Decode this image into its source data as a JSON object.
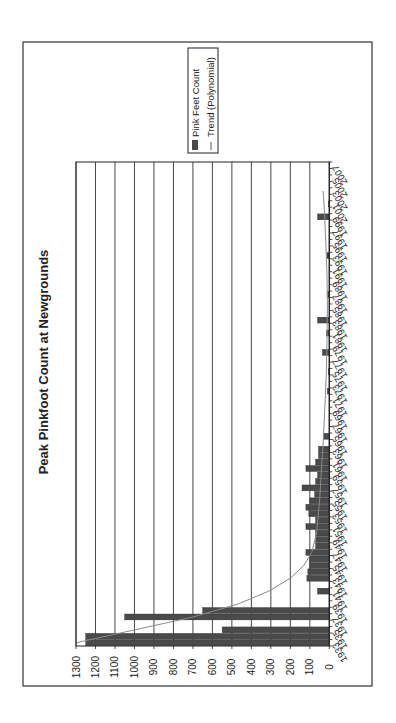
{
  "chart_data": {
    "type": "bar",
    "orientation_note": "figure rotated 90 degrees counter-clockwise",
    "title": "Peak Pinkfoot Count at Newgrounds",
    "xlabel": "",
    "ylabel": "",
    "ylim": [
      0,
      1300
    ],
    "yticks": [
      0,
      100,
      200,
      300,
      400,
      500,
      600,
      700,
      800,
      900,
      1000,
      1100,
      1200,
      1300
    ],
    "xlim": [
      1933,
      2007
    ],
    "xtick_labels": [
      "1933",
      "1935",
      "1937",
      "1939",
      "1941",
      "1943",
      "1945",
      "1947",
      "1949",
      "1951",
      "1953",
      "1955",
      "1957",
      "1959",
      "1961",
      "1963",
      "1965",
      "1967",
      "1969",
      "1971",
      "1973",
      "1975",
      "1977",
      "1979",
      "1981",
      "1983",
      "1985",
      "1987",
      "1989",
      "1991",
      "1993",
      "1995",
      "1997",
      "1999",
      "2001",
      "2003",
      "2005",
      "2007"
    ],
    "grid": true,
    "legend_position": "upper right (rotated)",
    "legend": [
      "Pink Feet Count",
      "Trend (Polynomial)"
    ],
    "series": [
      {
        "name": "Pink Feet Count",
        "type": "bar",
        "color": "#4a4a4a",
        "points": [
          {
            "x": 1933,
            "y": 1250
          },
          {
            "x": 1934,
            "y": 1250
          },
          {
            "x": 1935,
            "y": 550
          },
          {
            "x": 1936,
            "y": 0
          },
          {
            "x": 1937,
            "y": 1050
          },
          {
            "x": 1938,
            "y": 650
          },
          {
            "x": 1939,
            "y": 0
          },
          {
            "x": 1940,
            "y": 0
          },
          {
            "x": 1941,
            "y": 60
          },
          {
            "x": 1942,
            "y": 0
          },
          {
            "x": 1943,
            "y": 115
          },
          {
            "x": 1944,
            "y": 110
          },
          {
            "x": 1945,
            "y": 100
          },
          {
            "x": 1946,
            "y": 100
          },
          {
            "x": 1947,
            "y": 120
          },
          {
            "x": 1948,
            "y": 70
          },
          {
            "x": 1949,
            "y": 70
          },
          {
            "x": 1950,
            "y": 70
          },
          {
            "x": 1951,
            "y": 120
          },
          {
            "x": 1952,
            "y": 70
          },
          {
            "x": 1953,
            "y": 105
          },
          {
            "x": 1954,
            "y": 120
          },
          {
            "x": 1955,
            "y": 100
          },
          {
            "x": 1956,
            "y": 75
          },
          {
            "x": 1957,
            "y": 140
          },
          {
            "x": 1958,
            "y": 70
          },
          {
            "x": 1959,
            "y": 60
          },
          {
            "x": 1960,
            "y": 120
          },
          {
            "x": 1961,
            "y": 70
          },
          {
            "x": 1962,
            "y": 55
          },
          {
            "x": 1963,
            "y": 55
          },
          {
            "x": 1964,
            "y": 0
          },
          {
            "x": 1965,
            "y": 30
          },
          {
            "x": 1972,
            "y": 10
          },
          {
            "x": 1975,
            "y": 5
          },
          {
            "x": 1978,
            "y": 35
          },
          {
            "x": 1981,
            "y": 15
          },
          {
            "x": 1983,
            "y": 60
          },
          {
            "x": 1987,
            "y": 8
          },
          {
            "x": 1993,
            "y": 12
          },
          {
            "x": 1999,
            "y": 60
          },
          {
            "x": 2001,
            "y": 5
          }
        ]
      },
      {
        "name": "Trend (Polynomial)",
        "type": "line",
        "color": "#8a8a8a",
        "points": [
          {
            "x": 1933,
            "y": 1300
          },
          {
            "x": 1935,
            "y": 1000
          },
          {
            "x": 1937,
            "y": 700
          },
          {
            "x": 1939,
            "y": 470
          },
          {
            "x": 1941,
            "y": 310
          },
          {
            "x": 1943,
            "y": 200
          },
          {
            "x": 1945,
            "y": 130
          },
          {
            "x": 1947,
            "y": 90
          },
          {
            "x": 1950,
            "y": 65
          },
          {
            "x": 1955,
            "y": 50
          },
          {
            "x": 1960,
            "y": 40
          },
          {
            "x": 1965,
            "y": 30
          },
          {
            "x": 1970,
            "y": 22
          },
          {
            "x": 1975,
            "y": 15
          },
          {
            "x": 1980,
            "y": 12
          },
          {
            "x": 1985,
            "y": 10
          },
          {
            "x": 1990,
            "y": 12
          },
          {
            "x": 1995,
            "y": 18
          },
          {
            "x": 2000,
            "y": 25
          },
          {
            "x": 2003,
            "y": 32
          }
        ]
      }
    ]
  },
  "layout_px": {
    "frame": {
      "x": 23,
      "y": 42,
      "w": 349,
      "h": 644
    },
    "plot": {
      "zero_x": 329.3,
      "max_x": 76,
      "top_y": 162,
      "bottom_y": 646
    },
    "legend": {
      "x": 188,
      "y": 48,
      "w": 30,
      "h": 105
    },
    "title_pos": {
      "x": 48,
      "y": 362
    }
  }
}
